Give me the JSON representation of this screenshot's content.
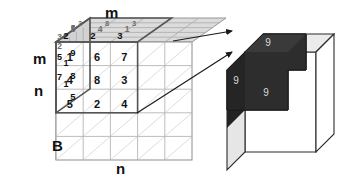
{
  "diagram": {
    "labels": {
      "top_m": "m",
      "left_m": "m",
      "left_n": "n",
      "bottom_b": "B",
      "bottom_n": "n"
    },
    "colors": {
      "grid_line": "#9a9a9a",
      "highlight_outline": "#555555",
      "top_face_fill": "#dcdcdc",
      "side_face_fill": "#d0d0d0",
      "front_face_fill": "#ffffff",
      "dark_block": "#2d2d2d",
      "dark_block_top": "#3a3a3a",
      "dark_block_side": "#232323",
      "arrow": "#1a1a1a",
      "text": "#111111",
      "dark_text": "#d8d8d8"
    }
  },
  "left_cube": {
    "name": "input-volume",
    "grid": {
      "cols": 5,
      "rows": 5,
      "depth": 5
    },
    "highlight_block": {
      "cols": 3,
      "rows": 3,
      "depth": 3
    },
    "front_face_values": [
      [
        "1",
        "6",
        "7"
      ],
      [
        "4",
        "8",
        "3"
      ],
      [
        "5",
        "2",
        "4"
      ]
    ],
    "top_face_values": [
      [
        "3",
        "8",
        "3"
      ],
      [
        "5",
        "4",
        "1"
      ],
      [
        "2",
        "2",
        "3"
      ]
    ],
    "left_face_values": [
      [
        "3",
        "5"
      ],
      [
        "2",
        "9"
      ],
      [
        "5",
        "1"
      ],
      [
        "7",
        "8"
      ],
      [
        "1",
        "5"
      ]
    ]
  },
  "right_cube": {
    "name": "output-volume",
    "result_values": {
      "top": "9",
      "left": "9",
      "front": "9"
    }
  },
  "arrows": [
    {
      "name": "arrow-top-face",
      "from": "highlight-top-right",
      "to": "dark-block-top"
    },
    {
      "name": "arrow-front-face",
      "from": "highlight-bottom-right",
      "to": "dark-block-front"
    }
  ]
}
